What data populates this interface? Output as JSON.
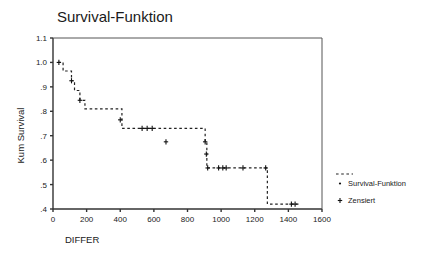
{
  "chart_data": {
    "type": "line",
    "title": "Survival-Funktion",
    "xlabel": "DIFFER",
    "ylabel": "Kum Survival",
    "xlim": [
      0,
      1600
    ],
    "ylim": [
      0.4,
      1.1
    ],
    "xticks": [
      0,
      200,
      400,
      600,
      800,
      1000,
      1200,
      1400,
      1600
    ],
    "xtick_labels": [
      "0",
      "200",
      "400",
      "600",
      "800",
      "1000",
      "1200",
      "1400",
      "1600"
    ],
    "yticks": [
      0.4,
      0.5,
      0.6,
      0.7,
      0.8,
      0.9,
      1.0,
      1.1
    ],
    "ytick_labels": [
      ".4",
      ".5",
      ".6",
      ".7",
      ".8",
      ".9",
      "1.0",
      "1.1"
    ],
    "grid": false,
    "linestyle": "dashed",
    "line_color": "#222222",
    "legend_position": "right",
    "legend": [
      {
        "name": "Survival-Funktion",
        "marker": "dot",
        "line": "dashed"
      },
      {
        "name": "Zensiert",
        "marker": "plus",
        "line": "none"
      }
    ],
    "series": [
      {
        "name": "Survival-Funktion",
        "kind": "step",
        "x": [
          30,
          60,
          95,
          110,
          128,
          160,
          190,
          395,
          410,
          672,
          905,
          915,
          1265,
          1275,
          1460
        ],
        "y": [
          1.0,
          0.965,
          0.965,
          0.925,
          0.885,
          0.845,
          0.81,
          0.81,
          0.73,
          0.73,
          0.675,
          0.568,
          0.568,
          0.42,
          0.42
        ]
      }
    ],
    "censored_points": {
      "name": "Zensiert",
      "x": [
        35,
        110,
        160,
        400,
        530,
        560,
        590,
        672,
        905,
        912,
        920,
        985,
        1010,
        1030,
        1130,
        1265,
        1418,
        1440
      ],
      "y": [
        1.0,
        0.925,
        0.845,
        0.765,
        0.73,
        0.73,
        0.73,
        0.675,
        0.675,
        0.625,
        0.568,
        0.568,
        0.568,
        0.568,
        0.568,
        0.568,
        0.42,
        0.42
      ]
    }
  }
}
